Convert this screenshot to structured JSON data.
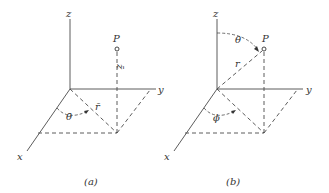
{
  "figure": {
    "panels": [
      {
        "caption": "(a)",
        "axes": {
          "z": "z",
          "y": "y",
          "x": "x"
        },
        "point": "P",
        "height_label": "z̄",
        "radius_label": "r̄",
        "angle_label": "θ̄"
      },
      {
        "caption": "(b)",
        "axes": {
          "z": "z",
          "y": "y",
          "x": "x"
        },
        "point": "P",
        "radius_label": "r",
        "polar_angle_label": "θ",
        "azimuth_label": "ϕ"
      }
    ],
    "line_color": "#4a4a4a",
    "text_color": "#333333"
  }
}
